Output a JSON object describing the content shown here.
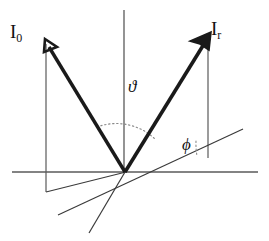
{
  "figure": {
    "width": 269,
    "height": 241,
    "background_color": "#ffffff",
    "stroke_color_thick": "#1a1a1a",
    "stroke_color_thin": "#555555",
    "stroke_color_dotted": "#777777"
  },
  "labels": {
    "incident_beam": {
      "symbol": "I",
      "subscript": "0",
      "text": "I0"
    },
    "reflected_beam": {
      "symbol": "I",
      "subscript": "r",
      "text": "Ir"
    },
    "angle_theta": {
      "glyph": "ϑ",
      "name": "vartheta"
    },
    "angle_phi": {
      "glyph": "ϕ",
      "name": "phi"
    }
  },
  "geometry": {
    "origin": {
      "x": 125,
      "y": 172
    },
    "vertical_axis": {
      "x": 124,
      "y_top": 10,
      "y_bottom": 172
    },
    "horizontal_axis": {
      "y": 172,
      "x_left": 12,
      "x_right": 258
    },
    "incident_vector": {
      "from_x": 46,
      "from_y": 42,
      "to_x": 125,
      "to_y": 172,
      "arrow_at": "from"
    },
    "reflected_vector": {
      "from_x": 125,
      "from_y": 172,
      "to_x": 210,
      "to_y": 34,
      "arrow_at": "to"
    },
    "tilted_line": {
      "x1": 58,
      "y1": 215,
      "x2": 243,
      "y2": 130
    },
    "secondary_line": {
      "x1": 90,
      "y1": 232,
      "x2": 125,
      "y2": 172
    },
    "incident_dropline": {
      "x": 46,
      "y_top": 44,
      "y_bottom": 192
    },
    "incident_baseline": {
      "y": 192,
      "x_left": 46,
      "x_right": 125
    },
    "reflected_dropline": {
      "x": 208,
      "y_top": 40,
      "y_bottom": 158
    },
    "theta_arc": {
      "radius": 54,
      "from_deg": 121,
      "to_deg": 58
    },
    "phi_arc": {
      "radius": 68,
      "from_deg": 24,
      "to_deg": 2
    }
  }
}
